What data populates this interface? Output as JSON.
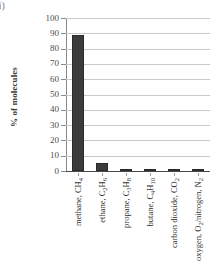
{
  "figure": {
    "label": "ii)"
  },
  "chart_data": {
    "type": "bar",
    "title": "",
    "xlabel": "",
    "ylabel": "% of molecules",
    "ylim": [
      0,
      100
    ],
    "ytick_step": 10,
    "grid": true,
    "legend": false,
    "bar_color": "#3c3c3c",
    "gridline_color": "#c9c9c9",
    "yticks": [
      "100",
      "90",
      "80",
      "70",
      "60",
      "50",
      "40",
      "30",
      "20",
      "10",
      "0"
    ],
    "categories": [
      "methane, CH4",
      "ethane, C2H6",
      "propane, C3H8",
      "butane, C4H10",
      "carbon dioxide, CO2",
      "oxygen, O2/nitrogen, N2"
    ],
    "category_labels_html": [
      "methane, CH<sub>4</sub>",
      "ethane, C<sub>2</sub>H<sub>6</sub>",
      "propane, C<sub>3</sub>H<sub>8</sub>",
      "butane, C<sub>4</sub>H<sub>10</sub>",
      "carbon dioxide, CO<sub>2</sub>",
      "oxygen, O<sub>2</sub>/nitrogen, N<sub>2</sub>"
    ],
    "values": [
      89,
      5,
      1,
      1,
      1.5,
      1.5
    ]
  }
}
